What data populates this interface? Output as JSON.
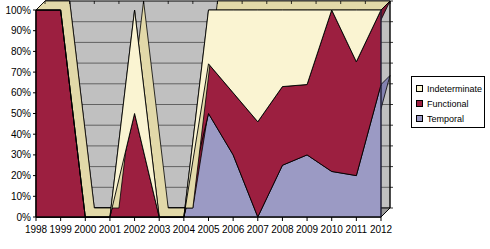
{
  "chart_data": {
    "type": "area",
    "stacked": "100%",
    "title": "",
    "xlabel": "",
    "ylabel": "",
    "categories": [
      "1998",
      "1999",
      "2000",
      "2001",
      "2002",
      "2003",
      "2004",
      "2005",
      "2006",
      "2007",
      "2008",
      "2009",
      "2010",
      "2011",
      "2012"
    ],
    "ylim": [
      0,
      100
    ],
    "ytick_labels": [
      "0%",
      "10%",
      "20%",
      "30%",
      "40%",
      "50%",
      "60%",
      "70%",
      "80%",
      "90%",
      "100%"
    ],
    "ytick_values": [
      0,
      10,
      20,
      30,
      40,
      50,
      60,
      70,
      80,
      90,
      100
    ],
    "grid": "horizontal",
    "legend_position": "right",
    "series": [
      {
        "name": "Temporal",
        "color": "#9b9ac4",
        "values": [
          0,
          0,
          0,
          0,
          0,
          0,
          0,
          50,
          30,
          0,
          25,
          30,
          22,
          20,
          64
        ]
      },
      {
        "name": "Functional",
        "color": "#9c1f40",
        "values": [
          100,
          100,
          0,
          0,
          50,
          0,
          0,
          24,
          30,
          46,
          38,
          34,
          78,
          55,
          36
        ]
      },
      {
        "name": "Indeterminate",
        "color": "#faf4d2",
        "values": [
          0,
          0,
          0,
          0,
          50,
          0,
          100,
          26,
          40,
          54,
          37,
          36,
          0,
          25,
          0
        ]
      }
    ],
    "cumulative_temporal": [
      0,
      0,
      0,
      0,
      0,
      0,
      0,
      50,
      30,
      0,
      25,
      30,
      22,
      20,
      64
    ],
    "cumulative_functional": [
      100,
      100,
      0,
      0,
      50,
      0,
      0,
      74,
      60,
      46,
      63,
      64,
      100,
      75,
      100
    ],
    "no_data_years": [
      "2000",
      "2001",
      "2003"
    ]
  },
  "legend": {
    "items": [
      {
        "label": "Indeterminate",
        "color": "#faf4d2"
      },
      {
        "label": "Functional",
        "color": "#9c1f40"
      },
      {
        "label": "Temporal",
        "color": "#9b9ac4"
      }
    ]
  },
  "axes": {
    "y_ticks": [
      "100%",
      "90%",
      "80%",
      "70%",
      "60%",
      "50%",
      "40%",
      "30%",
      "20%",
      "10%",
      "0%"
    ],
    "x_ticks": [
      "1998",
      "1999",
      "2000",
      "2001",
      "2002",
      "2003",
      "2004",
      "2005",
      "2006",
      "2007",
      "2008",
      "2009",
      "2010",
      "2011",
      "2012"
    ]
  }
}
